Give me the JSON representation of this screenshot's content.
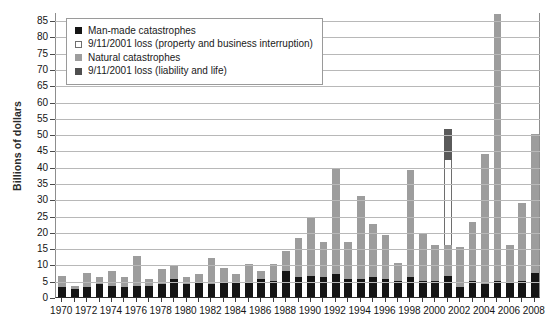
{
  "chart_data": {
    "type": "bar",
    "title": "",
    "subtitle": "",
    "xlabel": "",
    "ylabel": "Billions of dollars",
    "ylim": [
      0,
      87
    ],
    "yticks": [
      0,
      5,
      10,
      15,
      20,
      25,
      30,
      35,
      40,
      45,
      50,
      55,
      60,
      65,
      70,
      75,
      80,
      85
    ],
    "grid": true,
    "stacked": true,
    "legend_position": "top-left",
    "x": [
      1970,
      1971,
      1972,
      1973,
      1974,
      1975,
      1976,
      1977,
      1978,
      1979,
      1980,
      1981,
      1982,
      1983,
      1984,
      1985,
      1986,
      1987,
      1988,
      1989,
      1990,
      1991,
      1992,
      1993,
      1994,
      1995,
      1996,
      1997,
      1998,
      1999,
      2000,
      2001,
      2002,
      2003,
      2004,
      2005,
      2006,
      2007,
      2008
    ],
    "xtick_labels": [
      "1970",
      "1972",
      "1974",
      "1976",
      "1978",
      "1980",
      "1982",
      "1984",
      "1986",
      "1988",
      "1990",
      "1992",
      "1994",
      "1996",
      "1998",
      "2000",
      "2002",
      "2004",
      "2006",
      "2008"
    ],
    "colors": {
      "man_made": "#151515",
      "loss_property": "#ffffff",
      "natural": "#9d9d9d",
      "loss_liability": "#5a5a5a"
    },
    "series": [
      {
        "name": "Man-made catastrophes",
        "key": "man_made",
        "values": [
          3.0,
          2.5,
          3.0,
          4.0,
          3.5,
          3.0,
          3.5,
          3.5,
          4.0,
          5.5,
          4.0,
          4.5,
          4.0,
          4.5,
          4.5,
          4.5,
          5.5,
          5.0,
          8.0,
          6.0,
          6.5,
          6.0,
          7.0,
          5.5,
          5.5,
          6.0,
          5.5,
          5.0,
          6.0,
          5.0,
          5.0,
          6.5,
          3.0,
          5.0,
          4.0,
          5.0,
          4.5,
          5.0,
          7.5
        ]
      },
      {
        "name": "Natural catastrophes",
        "key": "natural",
        "values": [
          3.5,
          1.0,
          4.5,
          2.0,
          4.5,
          3.0,
          9.0,
          2.0,
          4.5,
          4.0,
          2.0,
          2.5,
          8.0,
          4.5,
          2.5,
          5.5,
          2.5,
          5.0,
          6.0,
          12.0,
          18.0,
          11.0,
          32.5,
          11.5,
          25.5,
          16.5,
          13.5,
          5.5,
          33.0,
          14.5,
          11.0,
          9.5,
          12.5,
          18.0,
          40.0,
          82.0,
          11.5,
          24.0,
          42.5
        ]
      },
      {
        "name": "9/11/2001 loss (property and business interruption)",
        "key": "loss_property",
        "values": [
          0,
          0,
          0,
          0,
          0,
          0,
          0,
          0,
          0,
          0,
          0,
          0,
          0,
          0,
          0,
          0,
          0,
          0,
          0,
          0,
          0,
          0,
          0,
          0,
          0,
          0,
          0,
          0,
          0,
          0,
          0,
          26.0,
          0,
          0,
          0,
          0,
          0,
          0,
          0
        ]
      },
      {
        "name": "9/11/2001 loss (liability and life)",
        "key": "loss_liability",
        "values": [
          0,
          0,
          0,
          0,
          0,
          0,
          0,
          0,
          0,
          0,
          0,
          0,
          0,
          0,
          0,
          0,
          0,
          0,
          0,
          0,
          0,
          0,
          0,
          0,
          0,
          0,
          0,
          0,
          0,
          0,
          0,
          9.5,
          0,
          0,
          0,
          0,
          0,
          0,
          0
        ]
      }
    ],
    "totals": [
      6.5,
      3.5,
      7.5,
      6.0,
      8.0,
      6.0,
      12.5,
      5.5,
      8.5,
      9.5,
      6.0,
      7.0,
      12.0,
      9.0,
      7.0,
      10.0,
      8.0,
      10.0,
      14.0,
      18.0,
      24.5,
      17.0,
      39.5,
      17.0,
      31.0,
      22.5,
      19.0,
      10.5,
      39.0,
      19.5,
      16.0,
      51.5,
      15.5,
      23.0,
      44.0,
      87.0,
      16.0,
      29.0,
      50.0
    ]
  },
  "legend": {
    "items": [
      {
        "label": "Man-made catastrophes",
        "swatch": "man-made-swatch"
      },
      {
        "label": "9/11/2001 loss (property and business interruption)",
        "swatch": "loss-property-swatch"
      },
      {
        "label": "Natural catastrophes",
        "swatch": "natural-swatch"
      },
      {
        "label": "9/11/2001 loss (liability and life)",
        "swatch": "loss-liability-swatch"
      }
    ]
  }
}
